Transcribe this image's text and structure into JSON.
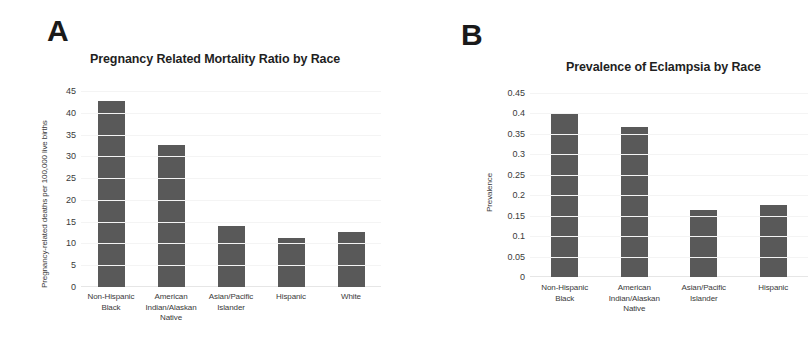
{
  "figure": {
    "panels": [
      {
        "letter": "A",
        "title": "Pregnancy Related Mortality Ratio by Race",
        "ylabel": "Pregnancy-related deaths per 100,000 live births"
      },
      {
        "letter": "B",
        "title": "Prevalence of Eclampsia by Race",
        "ylabel": "Prevalence"
      }
    ]
  },
  "chart_data": [
    {
      "type": "bar",
      "title": "Pregnancy Related Mortality Ratio by Race",
      "xlabel": "",
      "ylabel": "Pregnancy-related deaths per 100,000 live births",
      "categories": [
        "Non-Hispanic Black",
        "American Indian/Alaskan Native",
        "Asian/Pacific Islander",
        "Hispanic",
        "White"
      ],
      "values": [
        42.8,
        32.5,
        14,
        11.2,
        12.7
      ],
      "ylim": [
        0,
        45
      ],
      "yticks": [
        0,
        5,
        10,
        15,
        20,
        25,
        30,
        35,
        40,
        45
      ],
      "ytick_labels": [
        "0",
        "5",
        "10",
        "15",
        "20",
        "25",
        "30",
        "35",
        "40",
        "45"
      ],
      "grid": true,
      "legend": false,
      "bar_color": "#595959"
    },
    {
      "type": "bar",
      "title": "Prevalence of Eclampsia by Race",
      "xlabel": "",
      "ylabel": "Prevalence",
      "categories": [
        "Non-Hispanic Black",
        "American Indian/Alaskan Native",
        "Asian/Pacific Islander",
        "Hispanic"
      ],
      "values": [
        0.4,
        0.368,
        0.165,
        0.176
      ],
      "ylim": [
        0,
        0.45
      ],
      "yticks": [
        0,
        0.05,
        0.1,
        0.15,
        0.2,
        0.25,
        0.3,
        0.35,
        0.4,
        0.45
      ],
      "ytick_labels": [
        "0",
        "0.05",
        "0.1",
        "0.15",
        "0.2",
        "0.25",
        "0.3",
        "0.35",
        "0.4",
        "0.45"
      ],
      "grid": true,
      "legend": false,
      "bar_color": "#595959"
    }
  ]
}
